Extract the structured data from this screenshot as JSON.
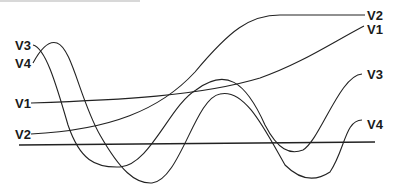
{
  "diagram": {
    "labels": {
      "left": {
        "v3": "V3",
        "v4": "V4",
        "v1": "V1",
        "v2": "V2"
      },
      "right": {
        "v2": "V2",
        "v1": "V1",
        "v3": "V3",
        "v4": "V4"
      }
    },
    "colors": {
      "stroke": "#222222",
      "background": "#ffffff"
    }
  }
}
